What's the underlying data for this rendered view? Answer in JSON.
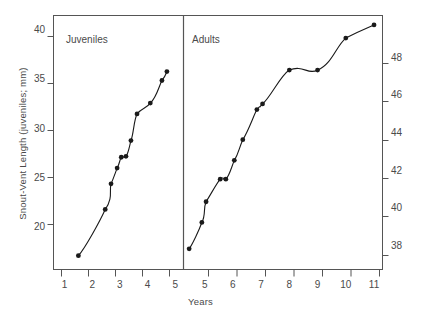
{
  "chart_data": {
    "type": "scatter",
    "title": "",
    "xlabel": "Years",
    "panels": [
      {
        "name": "juveniles",
        "label": "Juveniles",
        "ylabel": "Snout-Vent Length (juveniles; mm)",
        "yaxis_side": "left",
        "xlim": [
          0.6,
          5.3
        ],
        "ylim": [
          15.8,
          41.6
        ],
        "xticks": [
          1,
          2,
          3,
          4,
          5
        ],
        "xtick_labels": [
          "1",
          "2",
          "3",
          "4",
          "5"
        ],
        "yticks": [
          20,
          25,
          30,
          35,
          40
        ],
        "ytick_labels": [
          "20",
          "25",
          "30",
          "35",
          "40"
        ],
        "x": [
          1.5,
          2.47,
          2.68,
          2.9,
          3.05,
          3.22,
          3.4,
          3.62,
          4.1,
          4.52,
          4.7
        ],
        "y": [
          17.2,
          21.9,
          24.5,
          26.1,
          27.2,
          27.3,
          28.9,
          31.6,
          32.7,
          35.0,
          35.9
        ]
      },
      {
        "name": "adults",
        "label": "Adults",
        "ylabel": "Snout-Vent Length (adults; mm)",
        "yaxis_side": "right",
        "xlim": [
          4.25,
          11.3
        ],
        "ylim": [
          36.8,
          50.3
        ],
        "xticks": [
          5,
          6,
          7,
          8,
          9,
          10,
          11
        ],
        "xtick_labels": [
          "5",
          "6",
          "7",
          "8",
          "9",
          "10",
          "11"
        ],
        "yticks": [
          38,
          40,
          42,
          44,
          46,
          48
        ],
        "ytick_labels": [
          "38",
          "40",
          "42",
          "44",
          "46",
          "48"
        ],
        "x": [
          4.45,
          4.9,
          5.05,
          5.55,
          5.75,
          6.05,
          6.35,
          6.85,
          7.05,
          8.0,
          9.0,
          10.0,
          11.0
        ],
        "y": [
          37.9,
          39.3,
          40.4,
          41.6,
          41.6,
          42.6,
          43.7,
          45.3,
          45.6,
          47.4,
          47.4,
          49.1,
          49.8
        ]
      }
    ],
    "grid": false,
    "legend": "none",
    "marker": "filled-circle",
    "line": "smooth-fitted-curve",
    "colors": {
      "ink": "#1a1a1a",
      "text": "#4a4a4a",
      "frame": "#555555"
    }
  }
}
